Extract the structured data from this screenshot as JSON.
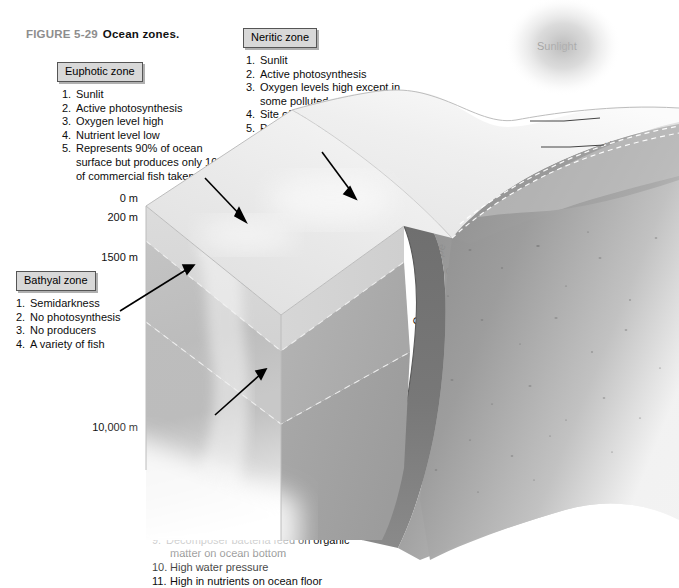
{
  "figure": {
    "number": "FIGURE 5-29",
    "title": "Ocean zones."
  },
  "colors": {
    "box_fill": "#d8d8d8",
    "box_border": "#555555",
    "surface_light": "#e9e9e9",
    "euphotic_face": "#d2d2d2",
    "bathyal_face": "#bdbdbd",
    "abyssal_face": "#b0b0b0",
    "seafloor": "#9a9a9a",
    "slope_dark": "#7d7d7d",
    "caption_gray": "#8d8d8d"
  },
  "callouts": [
    {
      "id": "euphotic",
      "label": "Euphotic zone",
      "items": [
        {
          "n": "1.",
          "text": "Sunlit"
        },
        {
          "n": "2.",
          "text": "Active photosynthesis"
        },
        {
          "n": "3.",
          "text": "Oxygen level high"
        },
        {
          "n": "4.",
          "text": "Nutrient level low"
        },
        {
          "n": "5.",
          "text": "Represents 90% of ocean"
        }
      ],
      "continuation": [
        "surface but produces only 10%",
        "of commercial fish taken each year"
      ]
    },
    {
      "id": "neritic",
      "label": "Neritic zone",
      "items": [
        {
          "n": "1.",
          "text": "Sunlit"
        },
        {
          "n": "2.",
          "text": "Active photosynthesis"
        },
        {
          "n": "3.",
          "text": "Oxygen levels high except in"
        },
        {
          "n": "4.",
          "text": "Site of major commercial fisheries"
        },
        {
          "n": "5.",
          "text": "Pollution occurring near shore"
        }
      ],
      "continuation": [
        "some polluted areas"
      ]
    },
    {
      "id": "bathyal",
      "label": "Bathyal zone",
      "items": [
        {
          "n": "1.",
          "text": "Semidarkness"
        },
        {
          "n": "2.",
          "text": "No photosynthesis"
        },
        {
          "n": "3.",
          "text": "No producers"
        },
        {
          "n": "4.",
          "text": "A variety of fish"
        }
      ],
      "continuation": []
    },
    {
      "id": "abyssal",
      "label": "Abyssal zone",
      "items": [
        {
          "n": "1.",
          "text": "Pitch dark"
        },
        {
          "n": "2.",
          "text": "No photosynthesis"
        },
        {
          "n": "3.",
          "text": "No producers"
        },
        {
          "n": "4.",
          "text": "Little oxygen"
        },
        {
          "n": "5.",
          "text": "Very cold water"
        },
        {
          "n": "6.",
          "text": "Contains 98% of ocean's species"
        },
        {
          "n": "7.",
          "text": "Animals are either predators or scavengers"
        },
        {
          "n": "8.",
          "text": "Many animals have bioluminescent organs"
        },
        {
          "n": "9.",
          "text": "Decomposer bacteria feed on organic"
        },
        {
          "n": "10.",
          "text": "High water pressure"
        },
        {
          "n": "11.",
          "text": "High in nutrients on ocean floor"
        }
      ],
      "continuation": [
        "matter on ocean bottom"
      ]
    }
  ],
  "depth_scale": [
    {
      "value": "0 m"
    },
    {
      "value": "200 m"
    },
    {
      "value": "1500 m"
    },
    {
      "value": "10,000 m"
    }
  ],
  "block_labels": {
    "neritic": "Neritic zone",
    "euphotic": "Euphotic zone",
    "bathyal": "Bathyal zone",
    "abyssal": "Abyssal zone",
    "continental_slope": "Continental slope",
    "continental_shelf": "Continental shelf"
  },
  "tides": {
    "low": "Low tide",
    "high": "High tide"
  },
  "sunlight": {
    "label": "Sunlight"
  }
}
